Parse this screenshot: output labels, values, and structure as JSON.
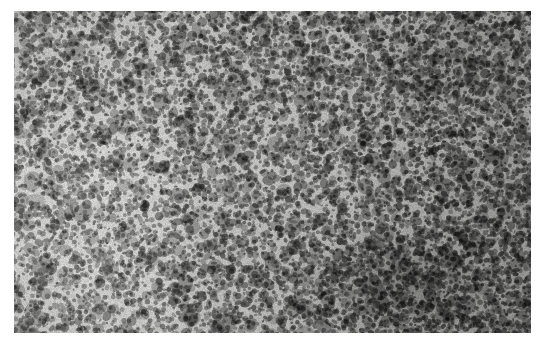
{
  "page": {
    "background_color": "#ffffff",
    "width": 547,
    "height": 350
  },
  "figure": {
    "kind": "histopathology-micrograph",
    "caption": "",
    "frame": {
      "x": 14,
      "y": 11,
      "width": 517,
      "height": 322
    },
    "border": {
      "visible": false,
      "color": "#ffffff"
    },
    "tones": {
      "background": "#eeeeec",
      "lightest": "#f6f6f4",
      "midtone": "#a8a8a6",
      "darkest": "#3a3a3a",
      "nuclei": "#4a4a4a"
    },
    "texture": {
      "nucleus_size_px": 3,
      "stipple_fine_spacing_px": 5,
      "stipple_mid_spacing_px": 9,
      "stipple_coarse_spacing_px": 17
    },
    "density_regions": [
      {
        "name": "upper-left",
        "relative_density": 0.58
      },
      {
        "name": "upper-centre",
        "relative_density": 0.62
      },
      {
        "name": "upper-right",
        "relative_density": 0.78
      },
      {
        "name": "centre-left-pale",
        "relative_density": 0.42
      },
      {
        "name": "centre",
        "relative_density": 0.55
      },
      {
        "name": "centre-right",
        "relative_density": 0.74
      },
      {
        "name": "lower-left",
        "relative_density": 0.48
      },
      {
        "name": "lower-centre",
        "relative_density": 0.66
      },
      {
        "name": "lower-right-dense",
        "relative_density": 0.92
      }
    ],
    "annotations": [],
    "scale_bar": {
      "visible": false,
      "label": ""
    },
    "labels": []
  }
}
